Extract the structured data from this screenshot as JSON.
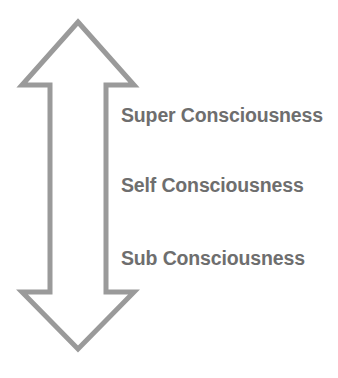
{
  "diagram": {
    "background_color": "#ffffff",
    "arrow": {
      "icon_name": "double-headed-vertical-arrow",
      "direction": "up-down",
      "stroke_color": "#9a9a9a",
      "fill_color": "#ffffff",
      "stroke_width": 5,
      "top_tip_y": 22,
      "bottom_tip_y": 349,
      "center_x": 78
    },
    "levels": [
      {
        "key": "super",
        "label": "Super Consciousness",
        "order": 1,
        "position": "top"
      },
      {
        "key": "self",
        "label": "Self Consciousness",
        "order": 2,
        "position": "middle"
      },
      {
        "key": "sub",
        "label": "Sub Consciousness",
        "order": 3,
        "position": "bottom"
      }
    ],
    "text_color": "#6e6e6e"
  }
}
